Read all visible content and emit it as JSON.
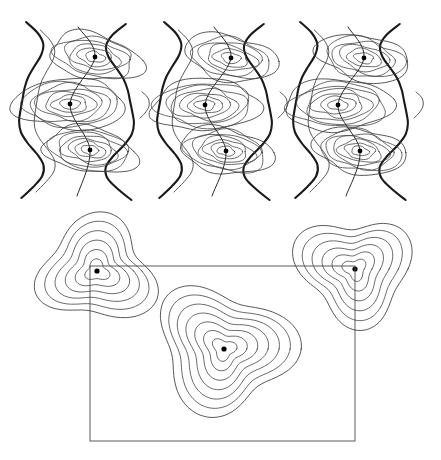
{
  "figure": {
    "background_color": "#ffffff",
    "width": 441,
    "height": 460,
    "line_color": "#3a3a3a",
    "boundary_color": "#1a1a1a",
    "frame_color": "#4a4a4a",
    "dot_color": "#000000"
  },
  "top_section": {
    "name": "three-wavy-contour-panels",
    "panel_count": 3,
    "panels": [
      {
        "id": "panel-1",
        "label": "left-panel",
        "origin_x": 14,
        "origin_y": 18,
        "peaks": [
          {
            "id": "peak-1a",
            "cx": 95,
            "cy": 57,
            "rings": 6
          },
          {
            "id": "peak-1b",
            "cx": 70,
            "cy": 104,
            "rings": 7
          },
          {
            "id": "peak-1c",
            "cx": 90,
            "cy": 150,
            "rings": 7
          }
        ],
        "crest_line": {
          "x1": 78,
          "y1": 27,
          "x2": 77,
          "y2": 196
        }
      },
      {
        "id": "panel-2",
        "label": "middle-panel",
        "origin_x": 152,
        "origin_y": 18,
        "peaks": [
          {
            "id": "peak-2a",
            "cx": 231,
            "cy": 58,
            "rings": 6
          },
          {
            "id": "peak-2b",
            "cx": 205,
            "cy": 105,
            "rings": 7
          },
          {
            "id": "peak-2c",
            "cx": 226,
            "cy": 151,
            "rings": 7
          }
        ],
        "crest_line": {
          "x1": 214,
          "y1": 27,
          "x2": 212,
          "y2": 196
        }
      },
      {
        "id": "panel-3",
        "label": "right-panel",
        "origin_x": 288,
        "origin_y": 18,
        "peaks": [
          {
            "id": "peak-3a",
            "cx": 364,
            "cy": 58,
            "rings": 6
          },
          {
            "id": "peak-3b",
            "cx": 338,
            "cy": 105,
            "rings": 7
          },
          {
            "id": "peak-3c",
            "cx": 360,
            "cy": 151,
            "rings": 7
          }
        ],
        "crest_line": {
          "x1": 348,
          "y1": 27,
          "x2": 346,
          "y2": 196
        }
      }
    ]
  },
  "bottom_section": {
    "name": "triangular-contour-clusters-with-frame",
    "frame": {
      "id": "bounding-rectangle",
      "x": 90,
      "y": 266,
      "width": 265,
      "height": 175
    },
    "clusters": [
      {
        "id": "cluster-left",
        "label": "upper-left-cluster",
        "cx": 97,
        "cy": 271,
        "rings": 6,
        "rotation": -35
      },
      {
        "id": "cluster-center",
        "label": "center-cluster",
        "cx": 224,
        "cy": 349,
        "rings": 7,
        "rotation": 10
      },
      {
        "id": "cluster-right",
        "label": "upper-right-cluster",
        "cx": 355,
        "cy": 269,
        "rings": 6,
        "rotation": 35
      }
    ]
  }
}
